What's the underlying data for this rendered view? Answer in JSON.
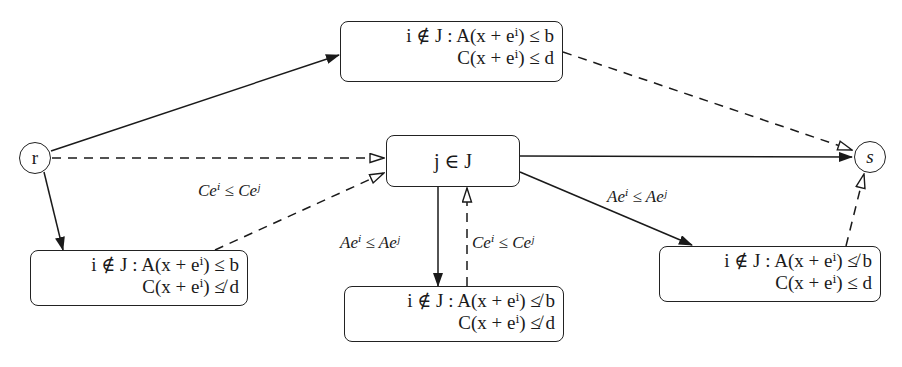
{
  "diagram": {
    "nodes": {
      "r": {
        "label": "r"
      },
      "s": {
        "label": "s"
      },
      "top": {
        "line1": "i ∉ J : A(x + eⁱ) ≤ b",
        "line2": "C(x + eⁱ) ≤ d"
      },
      "center": {
        "label": "j ∈ J"
      },
      "bottom_left": {
        "line1": "i ∉ J : A(x + eⁱ) ≤ b",
        "line2": "C(x + eⁱ) ≰ d"
      },
      "bottom_mid": {
        "line1": "i ∉ J : A(x + eⁱ) ≰ b",
        "line2": "C(x + eⁱ) ≰ d"
      },
      "bottom_right": {
        "line1": "i ∉ J : A(x + eⁱ) ≰ b",
        "line2": "C(x + eⁱ) ≤ d"
      }
    },
    "edge_labels": {
      "bl_to_center": "Ceⁱ ≤ Ceʲ",
      "center_to_bm": "Aeⁱ ≤ Aeʲ",
      "bm_to_center": "Ceⁱ ≤ Ceʲ",
      "center_to_br": "Aeⁱ ≤ Aeʲ"
    },
    "edges": [
      {
        "from": "r",
        "to": "top",
        "style": "solid"
      },
      {
        "from": "r",
        "to": "center",
        "style": "dashed"
      },
      {
        "from": "r",
        "to": "bottom_left",
        "style": "solid"
      },
      {
        "from": "bottom_left",
        "to": "center",
        "style": "dashed",
        "label": "Ceⁱ ≤ Ceʲ"
      },
      {
        "from": "top",
        "to": "s",
        "style": "dashed"
      },
      {
        "from": "center",
        "to": "s",
        "style": "solid"
      },
      {
        "from": "center",
        "to": "bottom_mid",
        "style": "solid",
        "label": "Aeⁱ ≤ Aeʲ"
      },
      {
        "from": "bottom_mid",
        "to": "center",
        "style": "dashed",
        "label": "Ceⁱ ≤ Ceʲ"
      },
      {
        "from": "center",
        "to": "bottom_right",
        "style": "solid",
        "label": "Aeⁱ ≤ Aeʲ"
      },
      {
        "from": "bottom_right",
        "to": "s",
        "style": "dashed"
      }
    ]
  }
}
